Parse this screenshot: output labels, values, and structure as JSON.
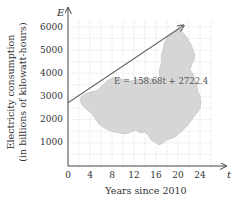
{
  "chart_data": {
    "type": "line",
    "title": "",
    "xlabel": "Years since 2010",
    "ylabel_line1": "Electricity consumption",
    "ylabel_line2": "(in billions of kilowatt-hours)",
    "x_var": "t",
    "y_var": "E",
    "x_ticks": [
      "0",
      "4",
      "8",
      "12",
      "16",
      "20",
      "24"
    ],
    "y_ticks": [
      "1000",
      "2000",
      "3000",
      "4000",
      "5000",
      "6000"
    ],
    "xlim": [
      0,
      26
    ],
    "ylim": [
      0,
      6000
    ],
    "grid": true,
    "grid_step_x": 2,
    "grid_step_y": 500,
    "series": [
      {
        "name": "E = 158.68t + 2722.4",
        "slope": 158.68,
        "intercept": 2722.4,
        "x": [
          0,
          21
        ],
        "values": [
          2722.4,
          6054.7
        ]
      }
    ],
    "annotation": "E = 158.68t + 2722.4",
    "background_image": "map of China (gray silhouette)",
    "colors": {
      "line": "#6b6b6b",
      "map": "#d6d6d6",
      "grid": "#c8c8c8",
      "axis": "#444444"
    }
  }
}
